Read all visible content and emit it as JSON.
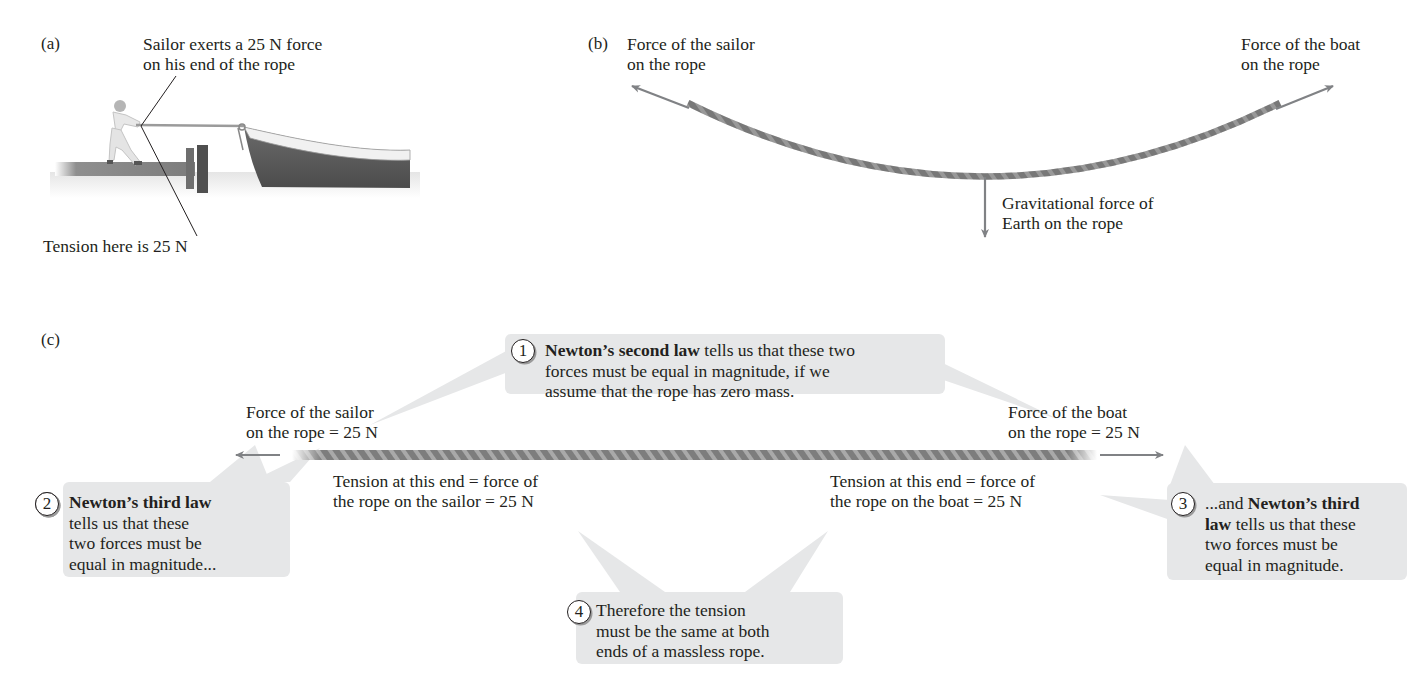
{
  "panel_a": {
    "label": "(a)",
    "caption_line1": "Sailor exerts a 25 N force",
    "caption_line2": "on his end of the rope",
    "tension_label": "Tension here is 25 N"
  },
  "panel_b": {
    "label": "(b)",
    "sailor_force_line1": "Force of the sailor",
    "sailor_force_line2": "on the rope",
    "boat_force_line1": "Force of the boat",
    "boat_force_line2": "on the rope",
    "gravity_line1": "Gravitational force of",
    "gravity_line2": "Earth on the rope"
  },
  "panel_c": {
    "label": "(c)",
    "sailor_force_line1": "Force of the sailor",
    "sailor_force_line2": "on the rope = 25 N",
    "boat_force_line1": "Force of the boat",
    "boat_force_line2": "on the rope = 25 N",
    "tension_sailor_line1": "Tension at this end = force of",
    "tension_sailor_line2": "the rope on the sailor = 25 N",
    "tension_boat_line1": "Tension at this end = force of",
    "tension_boat_line2": "the rope on the boat = 25 N",
    "bubbles": [
      {
        "number": "1",
        "bold": "Newton’s second law",
        "rest_line1": " tells us that these two",
        "line2": "forces must be equal in magnitude, if we",
        "line3": "assume that the rope has zero mass."
      },
      {
        "number": "2",
        "bold": "Newton’s third law",
        "line2": "tells us that these",
        "line3": "two forces must be",
        "line4": "equal in magnitude..."
      },
      {
        "number": "3",
        "pre": "...and ",
        "bold1": "Newton’s third",
        "bold2": "law",
        "rest_line2": " tells us that these",
        "line3": "two forces must be",
        "line4": "equal in magnitude."
      },
      {
        "number": "4",
        "line1": "Therefore the tension",
        "line2": "must be the same at both",
        "line3": "ends of a massless rope."
      }
    ]
  },
  "colors": {
    "text": "#231f20",
    "arrow": "#808285",
    "bubble_fill": "#e6e7e8",
    "rope": "#8a8a8a"
  }
}
